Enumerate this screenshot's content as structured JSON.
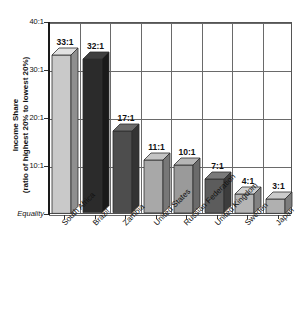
{
  "chart_data": {
    "type": "bar",
    "title": "",
    "xlabel": "",
    "ylabel": "Income Share (ratio of highest 20% to lowest 20%)",
    "ylabel_line1": "Income Share",
    "ylabel_line2": "(ratio of highest 20% to lowest 20%)",
    "categories": [
      "South Africa",
      "Brazil",
      "Zambia",
      "United States",
      "Russian Federation",
      "United Kingdom",
      "Sweden",
      "Japan"
    ],
    "values": [
      33,
      32,
      17,
      11,
      10,
      7,
      4,
      3
    ],
    "value_labels": [
      "33:1",
      "32:1",
      "17:1",
      "11:1",
      "10:1",
      "7:1",
      "4:1",
      "3:1"
    ],
    "ytick_values": [
      0,
      10,
      20,
      30,
      40
    ],
    "ytick_labels": [
      "Equality",
      "10:1",
      "20:1",
      "30:1",
      "40:1"
    ],
    "ylim": [
      0,
      40
    ],
    "grid": true,
    "legend": "none",
    "bar_colors": [
      "#c9c9c9",
      "#2b2b2b",
      "#4d4d4d",
      "#a8a8a8",
      "#9a9a9a",
      "#5c5c5c",
      "#b5b5b5",
      "#b0b0b0"
    ],
    "bar_top_colors": [
      "#e2e2e2",
      "#3f3f3f",
      "#6b6b6b",
      "#c4c4c4",
      "#b6b6b6",
      "#7a7a7a",
      "#d0d0d0",
      "#cbcbcb"
    ],
    "bar_side_colors": [
      "#8f8f8f",
      "#1a1a1a",
      "#333333",
      "#777777",
      "#6b6b6b",
      "#3d3d3d",
      "#828282",
      "#7d7d7d"
    ],
    "axis_color": "#555555",
    "grid_color": "#6a6a6a"
  }
}
